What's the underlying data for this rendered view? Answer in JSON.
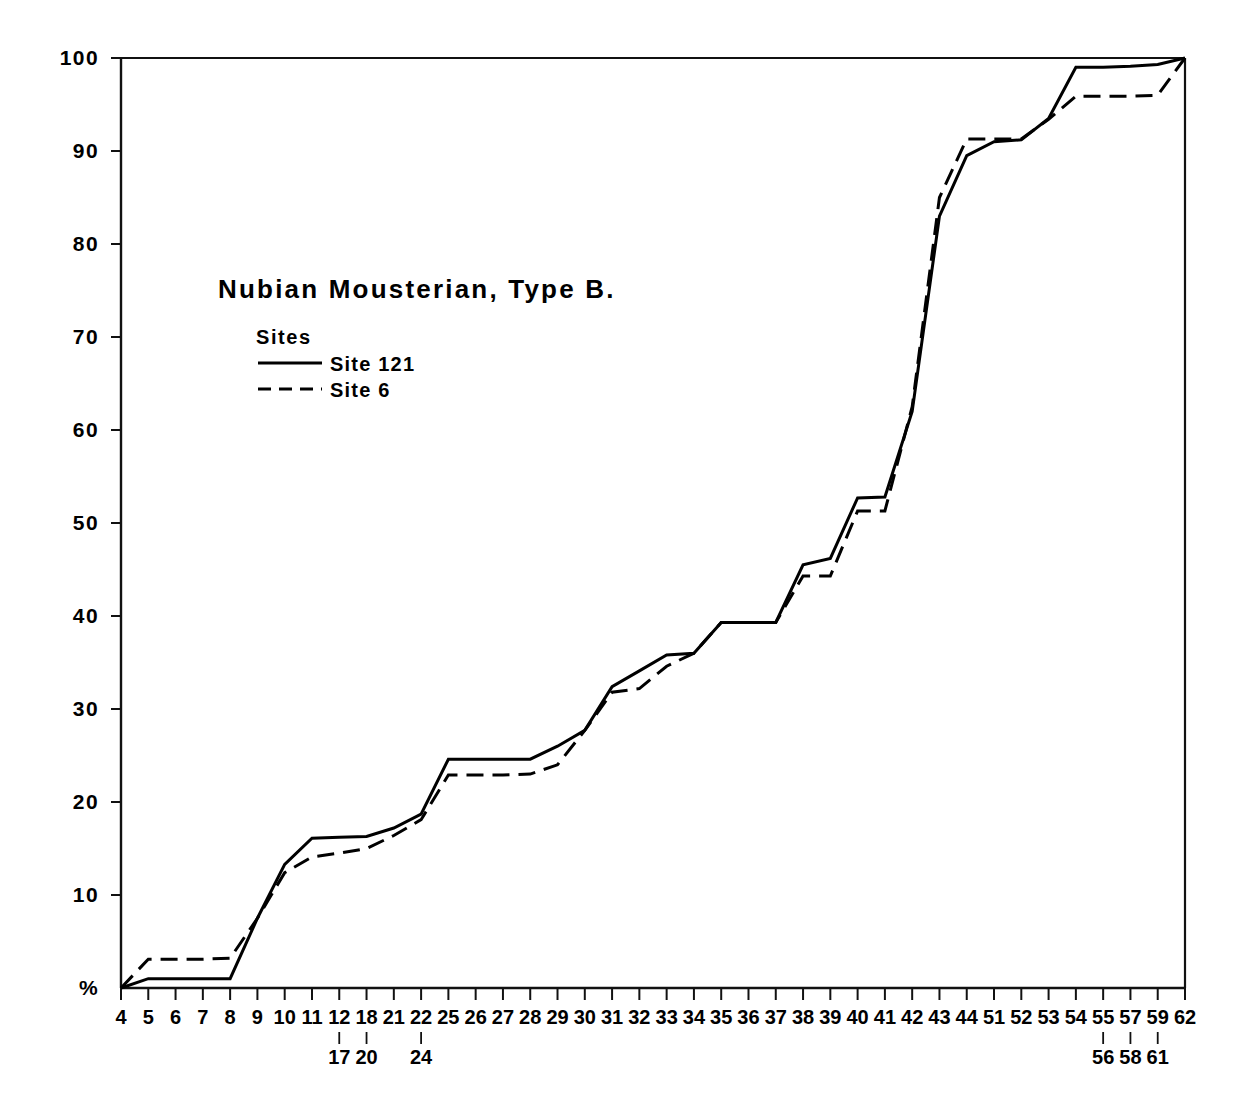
{
  "chart_data": {
    "type": "line",
    "title": "Nubian Mousterian,  Type B.",
    "xlabel": "",
    "ylabel": "%",
    "ylim": [
      0,
      100
    ],
    "grid": false,
    "legend_position": "upper-left-inside",
    "legend_title": "Sites",
    "y_ticks": [
      "100",
      "90",
      "80",
      "70",
      "60",
      "50",
      "40",
      "30",
      "20",
      "10",
      "%"
    ],
    "y_tick_values": [
      100,
      90,
      80,
      70,
      60,
      50,
      40,
      30,
      20,
      10,
      0
    ],
    "categories": [
      "4",
      "5",
      "6",
      "7",
      "8",
      "9",
      "10",
      "11",
      "12",
      "18",
      "21",
      "22",
      "25",
      "26",
      "27",
      "28",
      "29",
      "30",
      "31",
      "32",
      "33",
      "34",
      "35",
      "36",
      "37",
      "38",
      "39",
      "40",
      "41",
      "42",
      "43",
      "44",
      "51",
      "52",
      "53",
      "54",
      "55",
      "57",
      "59",
      "62"
    ],
    "category_sublabels": [
      null,
      null,
      null,
      null,
      null,
      null,
      null,
      null,
      "17",
      "20",
      null,
      "24",
      null,
      null,
      null,
      null,
      null,
      null,
      null,
      null,
      null,
      null,
      null,
      null,
      null,
      null,
      null,
      null,
      null,
      null,
      null,
      null,
      null,
      null,
      null,
      null,
      "56",
      "58",
      "61",
      null
    ],
    "series": [
      {
        "name": "Site 121",
        "style": "solid",
        "values": [
          0,
          1.0,
          1.0,
          1.0,
          1.0,
          7.5,
          13.3,
          16.1,
          16.2,
          16.3,
          17.2,
          18.7,
          24.6,
          24.6,
          24.6,
          24.6,
          26.0,
          27.7,
          32.4,
          34.1,
          35.8,
          36.0,
          39.3,
          39.3,
          39.3,
          45.5,
          46.2,
          52.7,
          52.8,
          62.0,
          83.0,
          89.5,
          91.0,
          91.2,
          93.5,
          99.0,
          99.0,
          99.1,
          99.3,
          100
        ]
      },
      {
        "name": "Site 6",
        "style": "dashed",
        "values": [
          0,
          3.1,
          3.1,
          3.1,
          3.2,
          7.5,
          12.4,
          14.1,
          14.5,
          15.0,
          16.4,
          18.1,
          22.9,
          22.9,
          22.9,
          23.0,
          24.0,
          27.7,
          31.8,
          32.2,
          34.6,
          36.0,
          39.3,
          39.3,
          39.3,
          44.3,
          44.3,
          51.3,
          51.3,
          62.5,
          85.0,
          91.3,
          91.3,
          91.3,
          93.4,
          95.9,
          95.9,
          95.9,
          96.0,
          100
        ]
      }
    ]
  },
  "legend": {
    "title": "Sites",
    "entries": [
      {
        "label": "Site 121",
        "style": "solid"
      },
      {
        "label": "Site 6",
        "style": "dashed"
      }
    ]
  },
  "axes": {
    "y_axis_label": "%",
    "y_tick_labels": [
      "100",
      "90",
      "80",
      "70",
      "60",
      "50",
      "40",
      "30",
      "20",
      "10",
      "%"
    ]
  }
}
